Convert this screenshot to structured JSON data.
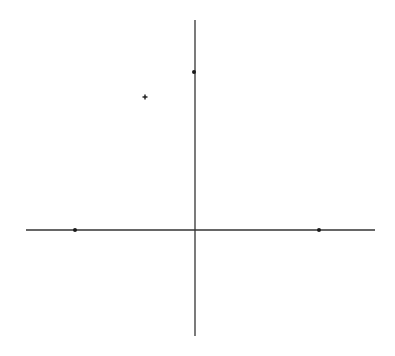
{
  "diagram": {
    "type": "coordinate-plane",
    "background": "#ffffff",
    "line_color": "#333333",
    "point_color": "#1a1a1a",
    "axes": {
      "horizontal": {
        "x1": 26,
        "y": 230,
        "x2": 375
      },
      "vertical": {
        "x": 195,
        "y1": 20,
        "y2": 336
      }
    },
    "points": [
      {
        "name": "left-x-axis-point",
        "x": 75,
        "y": 230,
        "shape": "dot"
      },
      {
        "name": "right-x-axis-point",
        "x": 319,
        "y": 230,
        "shape": "dot"
      },
      {
        "name": "upper-y-axis-point",
        "x": 194,
        "y": 72,
        "shape": "dot"
      },
      {
        "name": "plus-marker",
        "x": 145,
        "y": 97,
        "shape": "plus"
      }
    ]
  }
}
